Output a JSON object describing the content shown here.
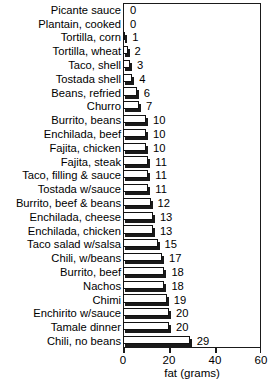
{
  "chart_data": {
    "type": "bar",
    "orientation": "horizontal",
    "title": "",
    "xlabel": "fat (grams)",
    "ylabel": "",
    "xlim": [
      0,
      60
    ],
    "xticks": [
      0,
      20,
      40,
      60
    ],
    "xtick_labels": [
      "0",
      "20",
      "40",
      "60"
    ],
    "grid": false,
    "legend": null,
    "bar_style": {
      "fill": "#ffffff",
      "edge": "#111111",
      "shadow": "#1a1a1a"
    },
    "categories": [
      "Picante sauce",
      "Plantain, cooked",
      "Tortilla, corn",
      "Tortilla, wheat",
      "Taco, shell",
      "Tostada shell",
      "Beans, refried",
      "Churro",
      "Burrito, beans",
      "Enchilada, beef",
      "Fajita, chicken",
      "Fajita, steak",
      "Taco, filling & sauce",
      "Tostada w/sauce",
      "Burrito, beef & beans",
      "Enchilada, cheese",
      "Enchilada, chicken",
      "Taco salad w/salsa",
      "Chili, w/beans",
      "Burrito, beef",
      "Nachos",
      "Chimi",
      "Enchirito w/sauce",
      "Tamale dinner",
      "Chili, no beans"
    ],
    "values": [
      0,
      0,
      1,
      2,
      3,
      4,
      6,
      7,
      10,
      10,
      10,
      11,
      11,
      11,
      12,
      13,
      13,
      15,
      17,
      18,
      18,
      19,
      20,
      20,
      29
    ],
    "value_labels": [
      "0",
      "0",
      "1",
      "2",
      "3",
      "4",
      "6",
      "7",
      "10",
      "10",
      "10",
      "11",
      "11",
      "11",
      "12",
      "13",
      "13",
      "15",
      "17",
      "18",
      "18",
      "19",
      "20",
      "20",
      "29"
    ]
  }
}
